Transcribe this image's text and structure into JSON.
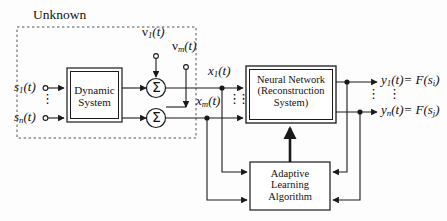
{
  "figure": {
    "type": "block-diagram",
    "background_color": "#fdfdfd",
    "line_color": "#1a1a1a",
    "text_color": "#111111"
  },
  "regions": {
    "unknown": {
      "label": "Unknown",
      "border_style": "dashed"
    }
  },
  "blocks": {
    "dynamic_system": {
      "lines": [
        "Dynamic",
        "System"
      ],
      "border": "double"
    },
    "neural_network": {
      "lines": [
        "Neural Network",
        "(Reconstruction",
        "System)"
      ],
      "border": "double"
    },
    "adaptive_learning": {
      "lines": [
        "Adaptive",
        "Learning",
        "Algorithm"
      ],
      "border": "single"
    }
  },
  "summing_junctions": [
    {
      "symbol": "Σ",
      "name": "summer-top"
    },
    {
      "symbol": "Σ",
      "name": "summer-bottom"
    }
  ],
  "signals": {
    "sources": [
      {
        "name": "source-1",
        "base": "s",
        "sub": "1",
        "suffix": "(t)"
      },
      {
        "name": "source-n",
        "base": "s",
        "sub": "n",
        "suffix": "(t)"
      }
    ],
    "noises": [
      {
        "name": "noise-1",
        "base": "ν",
        "sub": "1",
        "suffix": "(t)"
      },
      {
        "name": "noise-m",
        "base": "ν",
        "sub": "m",
        "suffix": "(t)"
      }
    ],
    "mixtures": [
      {
        "name": "mixture-1",
        "base": "x",
        "sub": "1",
        "suffix": "(t)"
      },
      {
        "name": "mixture-m",
        "base": "x",
        "sub": "m",
        "suffix": "(t)"
      }
    ],
    "outputs": [
      {
        "name": "output-1",
        "base": "y",
        "sub": "1",
        "suffix": "(t)",
        "equals": "= F(",
        "arg_base": "s",
        "arg_sub": "i",
        "arg_close": ")"
      },
      {
        "name": "output-n",
        "base": "y",
        "sub": "n",
        "suffix": "(t)",
        "equals": "= F(",
        "arg_base": "s",
        "arg_sub": "j",
        "arg_close": ")"
      }
    ]
  },
  "ellipses": {
    "glyph": "⋮",
    "count": 5
  }
}
